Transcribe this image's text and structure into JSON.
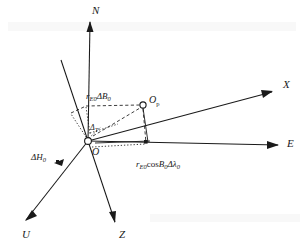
{
  "figure": {
    "background_color": "#ffffff",
    "line_color": "#1a1a1a",
    "width": 304,
    "height": 248
  },
  "axes": [
    {
      "id": "north",
      "label": "N",
      "direction": "up",
      "style": "solid",
      "label_x": 92,
      "label_y": 14
    },
    {
      "id": "east",
      "label": "E",
      "direction": "right",
      "style": "solid",
      "label_x": 287,
      "label_y": 147
    },
    {
      "id": "x-axis",
      "label": "X",
      "direction": "up-right",
      "style": "solid",
      "label_x": 283,
      "label_y": 88
    },
    {
      "id": "z-axis",
      "label": "Z",
      "direction": "down",
      "style": "solid",
      "label_x": 119,
      "label_y": 238
    },
    {
      "id": "u-axis",
      "label": "U",
      "direction": "down-left",
      "style": "solid",
      "label_x": 22,
      "label_y": 238
    },
    {
      "id": "oblique-axis",
      "label": "",
      "direction": "up-left",
      "style": "solid",
      "label_x": 0,
      "label_y": 0
    }
  ],
  "points": [
    {
      "id": "origin",
      "label": "O",
      "marker": "open-circle",
      "x": 88,
      "y": 141,
      "label_x": 92,
      "label_y": 155
    },
    {
      "id": "point-op",
      "label": "O",
      "sublabel": "p",
      "marker": "open-circle",
      "x": 143,
      "y": 105,
      "label_x": 149,
      "label_y": 103
    }
  ],
  "measures": [
    {
      "id": "delta-b",
      "text_main": "r",
      "text_sub1": "E0",
      "text_mid": "ΔB",
      "text_sub2": "0",
      "x": 86,
      "y": 99,
      "description": "meridian arc displacement"
    },
    {
      "id": "delta-lambda",
      "text_main": "r",
      "text_sub1": "E0",
      "text_mid": "cos",
      "text_italic": "B",
      "text_sub2": "0",
      "text_end": "Δλ",
      "text_sub3": "0",
      "x": 136,
      "y": 167,
      "description": "parallel arc displacement"
    },
    {
      "id": "delta-h",
      "text_main": "ΔH",
      "text_sub1": "0",
      "x": 31,
      "y": 160,
      "description": "height displacement"
    }
  ],
  "angles": [
    {
      "id": "angle-delta-t",
      "text_main": "Δ",
      "text_sub": "T",
      "x": 90,
      "y": 130,
      "description": "angle at origin between N axis and X axis projection"
    }
  ],
  "guide_lines": {
    "dashed_color": "#1a1a1a",
    "dotted_color": "#1a1a1a",
    "description": "dashed and dotted construction lines forming the displacement parallelepiped between O and Op"
  }
}
